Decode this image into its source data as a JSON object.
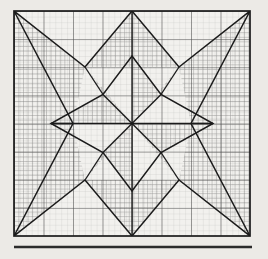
{
  "figure": {
    "title": "Eight-pointed star quilt block on graph paper",
    "icon_name": "star-quilt-block-icon",
    "caption": "",
    "colors": {
      "background": "#eceae6",
      "paper": "#f2f1ee",
      "ink": "#1b1b1b",
      "grid_minor": "#7c7c7c",
      "grid_major": "#3a3a3a",
      "hatch": "#2a2a2a",
      "rule": "#2b2b2b"
    },
    "frame": {
      "x": 14,
      "y": 11,
      "width": 236,
      "height": 225,
      "grid_cols": 8,
      "grid_rows": 8,
      "minor_per_cell": 5,
      "border_width_px": 1.6
    },
    "rule": {
      "x1": 14,
      "x2": 252,
      "y": 247,
      "thickness_px": 2.4
    },
    "geometry": {
      "center": {
        "x": 132,
        "y": 123.5
      },
      "outer_star_points": 8,
      "inner_star_points": 8,
      "description": "Large eight-pointed star whose four straight points touch the edge midpoints and whose four diagonal points touch the corners, drawn over a ruled grid; a concentric smaller eight-pointed star occupies the middle. Alternating wedge regions are filled with fine cross-hatching."
    },
    "legend": {
      "shaded_label": "",
      "blank_label": ""
    }
  }
}
